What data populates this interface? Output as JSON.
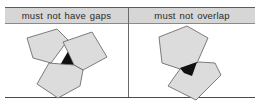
{
  "table": {
    "columns": [
      {
        "header": "must not have gaps",
        "illustration": "three-pentagons-with-gap"
      },
      {
        "header": "must not overlap",
        "illustration": "two-pentagons-overlapping"
      }
    ]
  },
  "colors": {
    "header_bg": "#d6d6d6",
    "polygon_fill": "#dcdcdc",
    "polygon_stroke": "#6e6e6e",
    "error_fill": "#111111",
    "rule_line": "#4a4a4a"
  }
}
